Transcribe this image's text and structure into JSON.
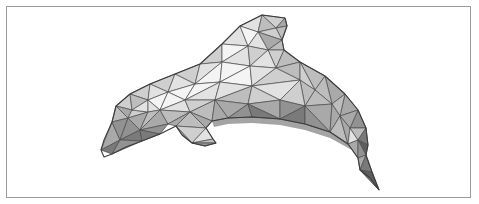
{
  "figure": {
    "frame_color": "#9a9a9a",
    "background": "#ffffff",
    "edge_color": "#4a4a4a"
  },
  "mesh": {
    "shades": [
      "#f4f4f4",
      "#e2e2e2",
      "#cfcfcf",
      "#bdbdbd",
      "#a9a9a9",
      "#929292",
      "#7a7a7a",
      "#5e5e5e"
    ],
    "outline": "101,150 104,140 112,122 116,106 130,94 150,84 175,74 200,64 222,44 240,26 262,15 285,18 287,26 282,40 284,50 300,62 325,76 345,94 358,110 366,128 368,145 366,155 372,172 379,190 370,178 360,170 358,158 348,144 330,132 305,124 280,119 252,117 228,118 212,121 206,128 213,139 216,143 205,146 192,143 182,135 176,126 160,134 142,141 126,147 112,154 104,157",
    "triangles": [
      {
        "p": "101,150 112,122 120,140",
        "s": 4
      },
      {
        "p": "101,150 120,140 112,154",
        "s": 6
      },
      {
        "p": "112,122 116,106 128,118",
        "s": 3
      },
      {
        "p": "112,122 128,118 120,140",
        "s": 5
      },
      {
        "p": "116,106 130,94 132,110",
        "s": 2
      },
      {
        "p": "116,106 132,110 128,118",
        "s": 4
      },
      {
        "p": "120,140 128,118 140,130",
        "s": 5
      },
      {
        "p": "120,140 140,130 142,141",
        "s": 6
      },
      {
        "p": "112,154 120,140 142,141",
        "s": 5
      },
      {
        "p": "128,118 132,110 148,112",
        "s": 2
      },
      {
        "p": "128,118 148,112 140,130",
        "s": 4
      },
      {
        "p": "130,94 150,84 148,100",
        "s": 2
      },
      {
        "p": "130,94 148,100 132,110",
        "s": 3
      },
      {
        "p": "132,110 148,100 148,112",
        "s": 1
      },
      {
        "p": "150,84 175,74 168,92",
        "s": 2
      },
      {
        "p": "150,84 168,92 148,100",
        "s": 1
      },
      {
        "p": "148,100 168,92 160,110",
        "s": 0
      },
      {
        "p": "148,100 160,110 148,112",
        "s": 1
      },
      {
        "p": "140,130 148,112 160,110",
        "s": 3
      },
      {
        "p": "140,130 160,110 168,124",
        "s": 4
      },
      {
        "p": "140,130 168,124 160,134",
        "s": 5
      },
      {
        "p": "140,130 160,134 142,141",
        "s": 6
      },
      {
        "p": "175,74 200,64 195,84",
        "s": 2
      },
      {
        "p": "175,74 195,84 168,92",
        "s": 1
      },
      {
        "p": "168,92 195,84 185,100",
        "s": 0
      },
      {
        "p": "168,92 185,100 160,110",
        "s": 0
      },
      {
        "p": "160,110 185,100 190,112",
        "s": 1
      },
      {
        "p": "160,110 190,112 168,124",
        "s": 3
      },
      {
        "p": "168,124 190,112 176,126",
        "s": 4
      },
      {
        "p": "176,126 190,112 206,128",
        "s": 3
      },
      {
        "p": "176,126 206,128 192,143",
        "s": 2
      },
      {
        "p": "192,143 206,128 213,139",
        "s": 1
      },
      {
        "p": "192,143 213,139 216,143",
        "s": 3
      },
      {
        "p": "192,143 216,143 205,146",
        "s": 5
      },
      {
        "p": "182,135 176,126 192,143",
        "s": 4
      },
      {
        "p": "200,64 222,44 222,62",
        "s": 2
      },
      {
        "p": "200,64 222,62 195,84",
        "s": 1
      },
      {
        "p": "195,84 222,62 220,82",
        "s": 0
      },
      {
        "p": "195,84 220,82 185,100",
        "s": 0
      },
      {
        "p": "185,100 220,82 215,100",
        "s": 1
      },
      {
        "p": "185,100 215,100 190,112",
        "s": 2
      },
      {
        "p": "190,112 215,100 212,121",
        "s": 3
      },
      {
        "p": "190,112 212,121 206,128",
        "s": 4
      },
      {
        "p": "222,44 240,26 248,46",
        "s": 1
      },
      {
        "p": "222,44 248,46 222,62",
        "s": 0
      },
      {
        "p": "240,26 262,15 258,32",
        "s": 1
      },
      {
        "p": "240,26 258,32 248,46",
        "s": 0
      },
      {
        "p": "262,15 285,18 276,28",
        "s": 2
      },
      {
        "p": "262,15 276,28 258,32",
        "s": 3
      },
      {
        "p": "285,18 287,26 276,28",
        "s": 4
      },
      {
        "p": "276,28 287,26 282,40",
        "s": 3
      },
      {
        "p": "258,32 276,28 282,40",
        "s": 2
      },
      {
        "p": "258,32 282,40 268,50",
        "s": 4
      },
      {
        "p": "248,46 258,32 268,50",
        "s": 1
      },
      {
        "p": "282,40 284,50 268,50",
        "s": 3
      },
      {
        "p": "222,62 248,46 250,66",
        "s": 1
      },
      {
        "p": "248,46 268,50 250,66",
        "s": 2
      },
      {
        "p": "268,50 284,50 276,68",
        "s": 2
      },
      {
        "p": "268,50 276,68 250,66",
        "s": 1
      },
      {
        "p": "284,50 300,62 276,68",
        "s": 3
      },
      {
        "p": "222,62 250,66 220,82",
        "s": 0
      },
      {
        "p": "220,82 250,66 252,86",
        "s": 0
      },
      {
        "p": "220,82 252,86 215,100",
        "s": 1
      },
      {
        "p": "250,66 276,68 252,86",
        "s": 1
      },
      {
        "p": "276,68 300,62 300,80",
        "s": 3
      },
      {
        "p": "276,68 300,80 252,86",
        "s": 2
      },
      {
        "p": "252,86 300,80 280,100",
        "s": 1
      },
      {
        "p": "215,100 252,86 248,104",
        "s": 3
      },
      {
        "p": "252,86 280,100 248,104",
        "s": 2
      },
      {
        "p": "215,100 248,104 228,118",
        "s": 4
      },
      {
        "p": "215,100 228,118 212,121",
        "s": 4
      },
      {
        "p": "228,118 248,104 252,117",
        "s": 5
      },
      {
        "p": "248,104 280,100 280,119",
        "s": 4
      },
      {
        "p": "248,104 280,119 252,117",
        "s": 6
      },
      {
        "p": "300,62 325,76 315,90",
        "s": 3
      },
      {
        "p": "300,62 315,90 300,80",
        "s": 2
      },
      {
        "p": "300,80 315,90 305,106",
        "s": 3
      },
      {
        "p": "300,80 305,106 280,100",
        "s": 2
      },
      {
        "p": "280,100 305,106 280,119",
        "s": 5
      },
      {
        "p": "280,119 305,106 305,124",
        "s": 6
      },
      {
        "p": "325,76 345,94 332,104",
        "s": 4
      },
      {
        "p": "325,76 332,104 315,90",
        "s": 3
      },
      {
        "p": "315,90 332,104 305,106",
        "s": 3
      },
      {
        "p": "305,106 332,104 330,132",
        "s": 4
      },
      {
        "p": "305,106 330,132 305,124",
        "s": 5
      },
      {
        "p": "345,94 358,110 340,116",
        "s": 4
      },
      {
        "p": "345,94 340,116 332,104",
        "s": 3
      },
      {
        "p": "332,104 340,116 330,132",
        "s": 4
      },
      {
        "p": "330,132 340,116 348,144",
        "s": 3
      },
      {
        "p": "358,110 366,128 350,128",
        "s": 5
      },
      {
        "p": "358,110 350,128 340,116",
        "s": 4
      },
      {
        "p": "340,116 350,128 348,144",
        "s": 4
      },
      {
        "p": "348,144 350,128 358,140",
        "s": 1
      },
      {
        "p": "350,128 366,128 358,140",
        "s": 3
      },
      {
        "p": "366,128 368,145 358,140",
        "s": 6
      },
      {
        "p": "348,144 358,140 358,158",
        "s": 4
      },
      {
        "p": "358,140 368,145 366,155",
        "s": 7
      },
      {
        "p": "358,140 366,155 358,158",
        "s": 5
      },
      {
        "p": "358,158 366,155 360,170",
        "s": 4
      },
      {
        "p": "366,155 372,172 360,170",
        "s": 6
      },
      {
        "p": "360,170 372,172 379,190",
        "s": 7
      },
      {
        "p": "360,170 379,190 370,178",
        "s": 5
      }
    ],
    "belly_shadow": "212,121 228,118 252,117 280,119 305,124 330,132 348,144 358,158 352,150 330,138 305,130 280,125 252,123 228,124 214,127"
  }
}
